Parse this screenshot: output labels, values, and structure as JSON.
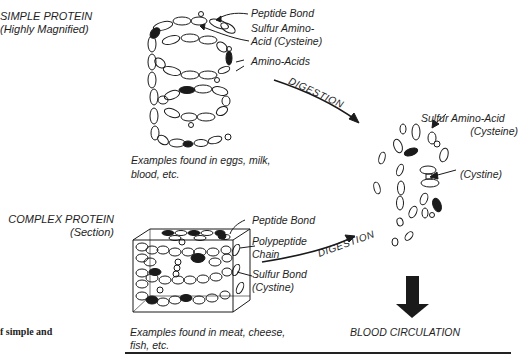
{
  "simple_protein": {
    "title": "SIMPLE PROTEIN",
    "subtitle": "(Highly Magnified)",
    "labels": {
      "peptide_bond": "Peptide Bond",
      "sulfur_amino_acid_line1": "Sulfur Amino-",
      "sulfur_amino_acid_line2": "Acid (Cysteine)",
      "amino_acids": "Amino-Acids"
    },
    "examples_line1": "Examples found in eggs, milk,",
    "examples_line2": "blood, etc."
  },
  "complex_protein": {
    "title": "COMPLEX PROTEIN",
    "subtitle": "(Section)",
    "labels": {
      "peptide_bond": "Peptide Bond",
      "polypeptide_line1": "Polypeptide",
      "polypeptide_line2": "Chain",
      "sulfur_bond_line1": "Sulfur Bond",
      "sulfur_bond_line2": "(Cystine)"
    },
    "examples_line1": "Examples found in meat, cheese,",
    "examples_line2": "fish, etc."
  },
  "digestion": {
    "upper_arrow_label": "DIGESTION",
    "lower_arrow_label": "DIGESTION"
  },
  "digested": {
    "sulfur_amino_acid_line1": "Sulfur Amino-Acid",
    "sulfur_amino_acid_line2": "(Cysteine)",
    "cystine": "(Cystine)",
    "destination": "BLOOD CIRCULATION"
  },
  "margin_text": "f simple and",
  "colors": {
    "ink": "#1a1a1a",
    "background": "#ffffff"
  }
}
